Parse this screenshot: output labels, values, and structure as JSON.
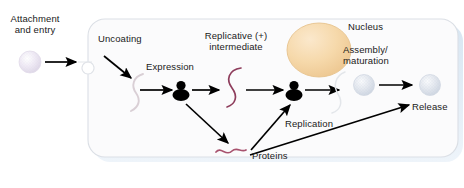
{
  "figure": {
    "type": "viral-replication-cycle-diagram",
    "background_color": "#ffffff"
  },
  "cell": {
    "name": "host-cell",
    "fill_color": "#fbfbfc",
    "border_color": "#dcdfe4",
    "shadow_color": "#dfe9f2"
  },
  "nucleus": {
    "label": "Nucleus",
    "fill_color": "#f5d9ae",
    "edge_color": "#e3bd83"
  },
  "labels": {
    "attachment": "Attachment\nand entry",
    "uncoating": "Uncoating",
    "expression": "Expression",
    "replicative_intermediate": "Replicative (+)\nintermediate",
    "nucleus": "Nucleus",
    "assembly": "Assembly/\nmaturation",
    "release": "Release",
    "replication": "Replication",
    "proteins": "Proteins"
  },
  "particles": [
    {
      "name": "incoming-virion",
      "color": "#ece7f2",
      "stage": "attachment"
    },
    {
      "name": "assembled-virion",
      "color": "#dfe4ed",
      "stage": "assembly"
    },
    {
      "name": "released-virion",
      "color": "#dfe4ed",
      "stage": "release"
    }
  ],
  "genomes": [
    {
      "name": "uncoated-genome",
      "color": "#d8ced4",
      "stage": "uncoating"
    },
    {
      "name": "replicative-intermediate-strand",
      "color": "#8e3d5c",
      "stage": "replication"
    },
    {
      "name": "protein-product-strand",
      "color": "#a8526e",
      "stage": "proteins"
    }
  ],
  "ribosomes": [
    {
      "name": "ribosome-expression",
      "color": "#000000"
    },
    {
      "name": "ribosome-replication",
      "color": "#000000"
    }
  ],
  "arrow_color": "#000000",
  "flow_steps": [
    "Attachment and entry",
    "Uncoating",
    "Expression",
    "Replicative (+) intermediate",
    "Replication",
    "Proteins",
    "Assembly/maturation",
    "Release"
  ]
}
